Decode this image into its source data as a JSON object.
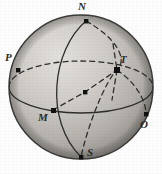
{
  "figure": {
    "type": "geometric-diagram",
    "background_color": "#fdfdfd",
    "sphere": {
      "center_x": 81,
      "center_y": 87,
      "radius": 72,
      "fill_light": "#d8d6d2",
      "fill_mid": "#bdbab5",
      "fill_dark": "#8e8b86",
      "outline_color": "#3a3a38"
    },
    "line_styles": {
      "solid_color": "#2e2e2c",
      "dashed_color": "#2e2e2c",
      "dash_pattern": "5 4",
      "stroke_width": 1.3
    },
    "marker": {
      "shape": "square",
      "color": "#111111",
      "size": 4
    },
    "points": [
      {
        "id": "N",
        "label": "N",
        "x": 86,
        "y": 21,
        "label_x": 78,
        "label_y": 2,
        "position": "top"
      },
      {
        "id": "P",
        "label": "P",
        "x": 18,
        "y": 70,
        "label_x": 6,
        "label_y": 54,
        "position": "left"
      },
      {
        "id": "T",
        "label": "T",
        "x": 117,
        "y": 70,
        "label_x": 120,
        "label_y": 56,
        "position": "right-center"
      },
      {
        "id": "M",
        "label": "M",
        "x": 53,
        "y": 110,
        "label_x": 39,
        "label_y": 113,
        "position": "lower-left"
      },
      {
        "id": "O",
        "label": "O",
        "x": 146,
        "y": 114,
        "label_x": 141,
        "label_y": 120,
        "position": "lower-right"
      },
      {
        "id": "S",
        "label": "S",
        "x": 81,
        "y": 157,
        "label_x": 87,
        "label_y": 148,
        "position": "bottom"
      },
      {
        "id": "mid",
        "label": "",
        "x": 85,
        "y": 92,
        "label_x": 0,
        "label_y": 0,
        "position": "center"
      }
    ],
    "curves": [
      {
        "id": "sphere-outline",
        "style": "solid",
        "description": "sphere limb circle"
      },
      {
        "id": "meridian-front",
        "style": "solid",
        "description": "great circle through N, M and S front arc"
      },
      {
        "id": "equator-front",
        "style": "solid",
        "description": "horizontal great circle front arc through M and O"
      },
      {
        "id": "equator-back",
        "style": "dashed",
        "description": "horizontal great circle back arc through P and T"
      },
      {
        "id": "meridian-oblique",
        "style": "dashed",
        "description": "oblique great circle through N, T and S"
      },
      {
        "id": "chord-M-T",
        "style": "dashed",
        "description": "dashed line from M through midpoint to T"
      },
      {
        "id": "arc-T-O",
        "style": "dashed",
        "description": "dashed arc from T down to O"
      },
      {
        "id": "ray-T-up",
        "style": "dashed",
        "description": "short dashed ray above T"
      },
      {
        "id": "ray-T-down",
        "style": "dashed",
        "description": "short dashed ray below T"
      }
    ]
  }
}
